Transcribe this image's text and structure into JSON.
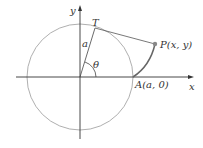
{
  "diagram": {
    "axes": {
      "x_label": "x",
      "y_label": "y"
    },
    "points": {
      "T": {
        "label": "T"
      },
      "P": {
        "label": "P(x, y)"
      },
      "A": {
        "label": "A(a, 0)"
      }
    },
    "radius_label": "a",
    "angle_label": "θ",
    "colors": {
      "circle": "#9a9a9a",
      "axes": "#333333",
      "tangent_line": "#555555",
      "involute_curve": "#666666",
      "point_P": "#888888"
    }
  }
}
